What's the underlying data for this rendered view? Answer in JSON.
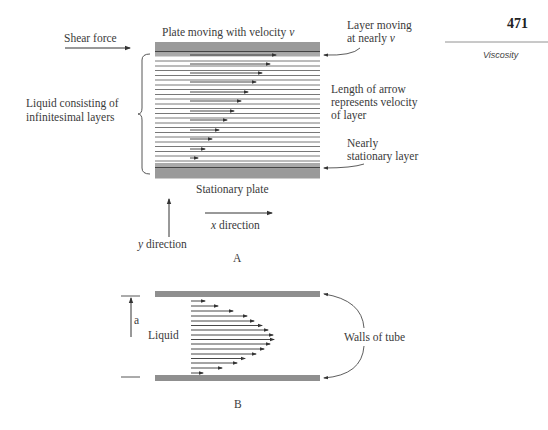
{
  "header": {
    "page_number": "471",
    "section": "Viscosity"
  },
  "diagram_a": {
    "caption": "A",
    "labels": {
      "shear_force": "Shear force",
      "top_plate": "Plate moving with velocity",
      "top_plate_var": "v",
      "layer_top_1": "Layer moving",
      "layer_top_2": "at nearly",
      "layer_top_var": "v",
      "liquid_1": "Liquid consisting of",
      "liquid_2": "infinitesimal layers",
      "arrow_len_1": "Length of arrow",
      "arrow_len_2": "represents velocity",
      "arrow_len_3": "of layer",
      "nearly_stat_1": "Nearly",
      "nearly_stat_2": "stationary layer",
      "stationary_plate": "Stationary plate",
      "x_dir_var": "x",
      "x_dir": "direction",
      "y_dir_var": "y",
      "y_dir": "direction"
    },
    "arrow_lengths_px": [
      126,
      120,
      112,
      106,
      98,
      91,
      84,
      77,
      69,
      62,
      54,
      46,
      38,
      20
    ]
  },
  "diagram_b": {
    "caption": "B",
    "labels": {
      "liquid": "Liquid",
      "radius": "a",
      "walls": "Walls of tube"
    },
    "arrow_lengths_px": [
      14,
      35,
      52,
      66,
      74,
      82,
      89,
      92,
      93,
      89,
      82,
      74,
      66,
      52,
      35,
      14
    ]
  }
}
